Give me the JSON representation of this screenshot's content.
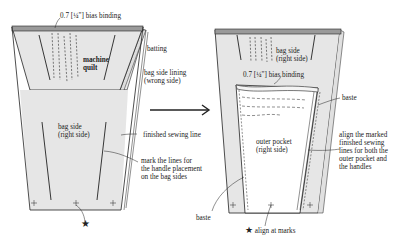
{
  "colors": {
    "fabric": "#e6e6e6",
    "binding": "#9a9a9a",
    "line": "#222222",
    "pocket": "#ffffff",
    "background": "#ffffff"
  },
  "left_panel": {
    "bias_binding": "0.7 [¼\"] bias binding",
    "machine_quilt": [
      "machine",
      "quilt"
    ],
    "batting": "batting",
    "lining": [
      "bag side lining",
      "(wrong side)"
    ],
    "bag_side": [
      "bag side",
      "(right side)"
    ],
    "finished_line": "finished sewing line",
    "mark_lines": [
      "mark the lines for",
      "the handle placement",
      "on the bag sides"
    ]
  },
  "arrow": {
    "icon": "right-arrow-icon"
  },
  "right_panel": {
    "bag_side": [
      "bag side",
      "(right side)"
    ],
    "bias_binding": "0.7 [¼\"] bias binding",
    "baste_top": "baste",
    "outer_pocket": [
      "outer pocket",
      "(right side)"
    ],
    "align_lines": [
      "align the marked",
      "finished sewing",
      "lines for both the",
      "outer pocket and",
      "the handles"
    ],
    "baste_bottom": "baste",
    "align_marks": "align at marks",
    "star_icon": "★"
  },
  "left_star": "★"
}
